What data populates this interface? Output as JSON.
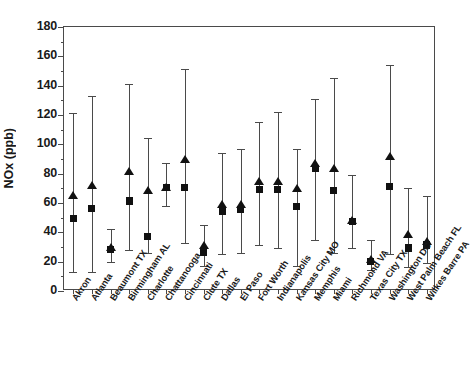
{
  "chart_data": {
    "type": "scatter",
    "title": "",
    "xlabel": "",
    "ylabel": "NOx (ppb)",
    "ylim": [
      0,
      180
    ],
    "ytick_labels": [
      "0",
      "20",
      "40",
      "60",
      "80",
      "100",
      "120",
      "140",
      "160",
      "180"
    ],
    "ytick_values": [
      0,
      20,
      40,
      60,
      80,
      100,
      120,
      140,
      160,
      180
    ],
    "yminor_step": 10,
    "grid": false,
    "legend": "none",
    "categories": [
      "Akron",
      "Atlanta",
      "Beaumont TX",
      "Birmingham AL",
      "Charlotte",
      "Chattanooga",
      "Cincinnati",
      "Clute TX",
      "Dallas",
      "El Paso",
      "Fort Worth",
      "Indianapolis",
      "Kansas City MO",
      "Memphis",
      "Miami",
      "Richmond VA",
      "Texas City TX",
      "Washington DC",
      "West Palm Beach FL",
      "Wilkes Barre PA"
    ],
    "series": [
      {
        "name": "triangle-marker",
        "marker": "triangle",
        "values": [
          64,
          71,
          29,
          81,
          68,
          70,
          89,
          30,
          58,
          58,
          74,
          74,
          69,
          86,
          83,
          47,
          21,
          91,
          38,
          33
        ]
      },
      {
        "name": "square-marker",
        "marker": "square",
        "values": [
          48,
          55,
          27,
          60,
          36,
          69,
          69,
          25,
          53,
          54,
          68,
          68,
          56,
          82,
          67,
          46,
          19,
          70,
          28,
          30
        ]
      }
    ],
    "error_bars": {
      "lower": [
        11,
        11,
        18,
        26,
        24,
        56,
        31,
        15,
        23,
        24,
        29,
        27,
        15,
        33,
        24,
        27,
        12,
        23,
        14,
        17
      ],
      "upper": [
        119,
        131,
        40,
        139,
        102,
        85,
        149,
        43,
        92,
        95,
        113,
        120,
        95,
        129,
        143,
        77,
        33,
        152,
        68,
        63
      ]
    }
  },
  "axis": {
    "y_label_text": "NOx (ppb)"
  }
}
